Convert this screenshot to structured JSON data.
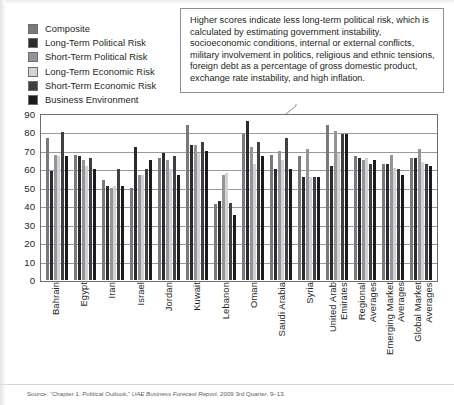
{
  "legend": {
    "items": [
      {
        "label": "Composite",
        "color": "#77797b"
      },
      {
        "label": "Long-Term Political Risk",
        "color": "#2b2b2d"
      },
      {
        "label": "Short-Term Political Risk",
        "color": "#93959a"
      },
      {
        "label": "Long-Term Economic Risk",
        "color": "#d2d3d5"
      },
      {
        "label": "Short-Term Economic Risk",
        "color": "#3f4042"
      },
      {
        "label": "Business Environment",
        "color": "#1b1b1c"
      }
    ]
  },
  "callout": {
    "text": "Higher scores indicate less long-term political risk, which is calculated by estimating government instability, socioeconomic conditions, internal or external conflicts, military involvement in politics, religious and ethnic tensions, foreign debt as a percentage of gross domestic product, exchange rate instability, and high inflation."
  },
  "source": {
    "prefix": "Source: “Chapter 1: Political Outlook,” ",
    "italic": "UAE Business Forecast Report,",
    "suffix": " 2009 3rd Quarter, 9–13."
  },
  "chart_data": {
    "type": "bar",
    "title": "",
    "xlabel": "",
    "ylabel": "",
    "ylim": [
      0,
      90
    ],
    "yticks": [
      0,
      10,
      20,
      30,
      40,
      50,
      60,
      70,
      80,
      90
    ],
    "grid": true,
    "legend_position": "top-left",
    "categories": [
      "Bahrain",
      "Egypt",
      "Iran",
      "Israel",
      "Jordan",
      "Kuwait",
      "Lebanon",
      "Oman",
      "Saudi Arabia",
      "Syria",
      "United Arab\nEmirates",
      "Regional\nAverages",
      "Emerging Market\nAverages",
      "Global Market\nAverages"
    ],
    "series": [
      {
        "name": "Composite",
        "color": "#77797b",
        "values": [
          77,
          68,
          54,
          50,
          66,
          84,
          41,
          79,
          68,
          67,
          84,
          67,
          63,
          66
        ]
      },
      {
        "name": "Long-Term Political Risk",
        "color": "#2b2b2d",
        "values": [
          59,
          67,
          51,
          72,
          69,
          73,
          43,
          86,
          60,
          56,
          62,
          66,
          63,
          66
        ]
      },
      {
        "name": "Short-Term Political Risk",
        "color": "#93959a",
        "values": [
          68,
          65,
          50,
          57,
          65,
          73,
          57,
          72,
          70,
          71,
          81,
          65,
          68,
          71
        ]
      },
      {
        "name": "Long-Term Economic Risk",
        "color": "#d2d3d5",
        "values": [
          67,
          62,
          51,
          57,
          60,
          69,
          58,
          63,
          65,
          56,
          69,
          66,
          61,
          64
        ]
      },
      {
        "name": "Short-Term Economic Risk",
        "color": "#3f4042",
        "values": [
          80,
          66,
          60,
          60,
          67,
          75,
          42,
          75,
          77,
          56,
          79,
          63,
          60,
          63
        ]
      },
      {
        "name": "Business Environment",
        "color": "#1b1b1c",
        "values": [
          67,
          60,
          51,
          65,
          57,
          70,
          35,
          67,
          60,
          56,
          79,
          65,
          57,
          62
        ]
      }
    ]
  }
}
